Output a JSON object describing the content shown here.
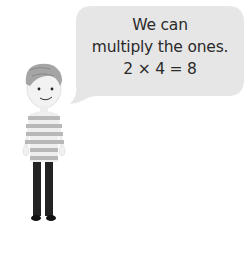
{
  "speech_bubble": {
    "lines": [
      "We can",
      "multiply the ones.",
      "2 × 4 = 8"
    ],
    "fill_color": "#e6e6e6",
    "text_color": "#2a2a2a"
  },
  "character": {
    "description": "boy with striped jumper",
    "hair_color": "#9a9a9a",
    "shirt_stripe_colors": [
      "#b5b5b5",
      "#eeeeee"
    ],
    "trousers_color": "#222222"
  }
}
